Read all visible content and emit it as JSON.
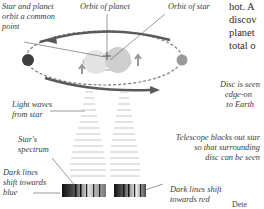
{
  "labels": {
    "common_point": [
      "Star and planet",
      "orbit a common",
      "point"
    ],
    "orbit_planet": "Orbit of planet",
    "orbit_star": "Orbit of star",
    "light_waves": [
      "Light waves",
      "from star"
    ],
    "disc_edge": [
      "Disc is seen",
      "edge-on",
      "to Earth"
    ],
    "telescope": [
      "Telescope blacks out star",
      "so that surrounding",
      "disc can be seen"
    ],
    "spectrum": [
      "Star's",
      "spectrum"
    ],
    "shift_blue": [
      "Dark lines",
      "shift towards",
      "blue"
    ],
    "shift_red": [
      "Dark lines shift",
      "towards red"
    ]
  },
  "body_text": [
    "hot. A",
    "discov",
    "planet",
    "total o"
  ],
  "footer_text": "Dete",
  "colors": {
    "orbit": "#6a6a6a",
    "planet": "#4a4a4a",
    "star": "#c8c8c8",
    "leader": "#555555"
  }
}
